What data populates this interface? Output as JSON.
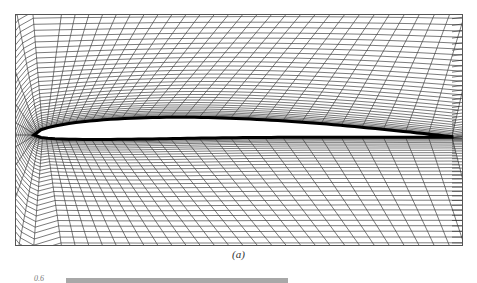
{
  "figure": {
    "caption": "(a)",
    "grid_line_color": "#222222",
    "airfoil_fill": "#ffffff"
  },
  "next_figure": {
    "axis_tick_label": "0.6",
    "bar_color": "#a8a8a8"
  }
}
